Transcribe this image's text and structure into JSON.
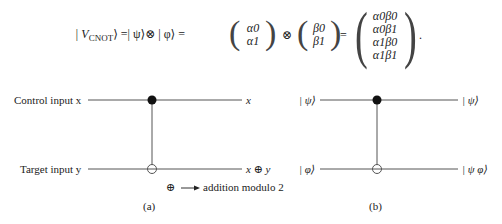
{
  "equation": {
    "lhs_prefix": "| V",
    "lhs_subscript": "CNOT",
    "lhs_suffix": "⟩ =| ψ⟩⊗ | φ⟩ =",
    "otimes": "⊗",
    "equals": "=",
    "period": ".",
    "vector_alpha": [
      "α0",
      "α1"
    ],
    "vector_beta": [
      "β0",
      "β1"
    ],
    "vector_result": [
      "α0β0",
      "α0β1",
      "α1β0",
      "α1β1"
    ]
  },
  "circuit_a": {
    "control_label": "Control input x",
    "target_label": "Target input y",
    "control_output": "x",
    "target_output": "x ⊕ y",
    "legend_symbol": "⊕",
    "legend_text": "addition modulo 2",
    "caption": "(a)"
  },
  "circuit_b": {
    "control_input": "| ψ⟩",
    "target_input": "| φ⟩",
    "control_output": "| ψ⟩",
    "target_output": "| ψ φ⟩",
    "caption": "(b)"
  },
  "colors": {
    "wire": "#555555",
    "dot": "#111111",
    "text": "#222222"
  }
}
